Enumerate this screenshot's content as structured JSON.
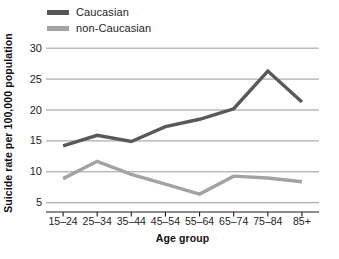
{
  "chart_data": {
    "type": "line",
    "title": "",
    "xlabel": "Age group",
    "ylabel": "Suicide rate per 100,000 population",
    "categories": [
      "15–24",
      "25–34",
      "35–44",
      "45–54",
      "55–64",
      "65–74",
      "75–84",
      "85+"
    ],
    "ylim": [
      3.5,
      31
    ],
    "yticks": [
      5,
      10,
      15,
      20,
      25,
      30
    ],
    "ytick_labels": [
      "5",
      "10",
      "15",
      "20",
      "25",
      "30"
    ],
    "grid": "horizontal",
    "legend_position": "top-left",
    "series": [
      {
        "name": "Caucasian",
        "color": "#595959",
        "values": [
          14.2,
          15.9,
          14.9,
          17.3,
          18.5,
          20.2,
          26.3,
          21.3
        ]
      },
      {
        "name": "non-Caucasian",
        "color": "#a3a3a3",
        "values": [
          8.9,
          11.7,
          9.6,
          8.0,
          6.4,
          9.3,
          9.0,
          8.4
        ]
      }
    ]
  },
  "legend": {
    "entries": [
      {
        "label": "Caucasian"
      },
      {
        "label": "non-Caucasian"
      }
    ]
  },
  "axes": {
    "x_title": "Age group",
    "y_title": "Suicide rate per 100,000 population"
  }
}
